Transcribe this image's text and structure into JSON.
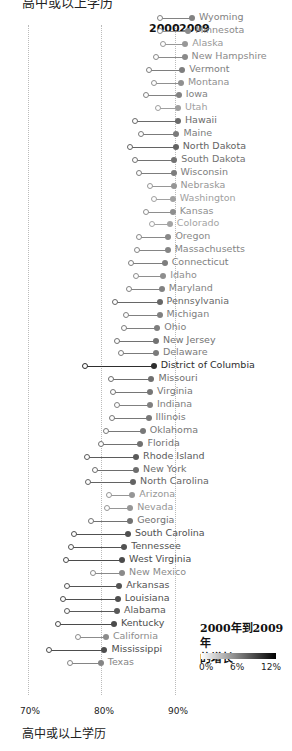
{
  "title_cut": "高中或以上学历",
  "headers": {
    "y2000": "2000",
    "y2009": "2009"
  },
  "axis": {
    "ticks": [
      "70%",
      "80%",
      "90%"
    ],
    "xtitle": "高中或以上学历"
  },
  "legend": {
    "title_line1": "2000年到2009年",
    "title_line2": "的增长",
    "ticks": [
      "0%",
      "6%",
      "12%"
    ]
  },
  "chart_data": {
    "type": "dot-plot",
    "title": "",
    "xlabel": "高中或以上学历",
    "xlim": [
      70,
      92
    ],
    "xticks": [
      "70%",
      "80%",
      "90%"
    ],
    "series_names": [
      "2000",
      "2009"
    ],
    "color_legend": {
      "title": "2000年到2009年的增长",
      "ticks": [
        "0%",
        "6%",
        "12%"
      ]
    },
    "rows": [
      {
        "state": "Wyoming",
        "v2000": 87.9,
        "v2009": 92.3
      },
      {
        "state": "Minnesota",
        "v2000": 87.9,
        "v2009": 91.8
      },
      {
        "state": "Alaska",
        "v2000": 88.3,
        "v2009": 91.4
      },
      {
        "state": "New Hampshire",
        "v2000": 87.4,
        "v2009": 91.3
      },
      {
        "state": "Vermont",
        "v2000": 86.4,
        "v2009": 91.0
      },
      {
        "state": "Montana",
        "v2000": 87.2,
        "v2009": 90.8
      },
      {
        "state": "Iowa",
        "v2000": 86.1,
        "v2009": 90.5
      },
      {
        "state": "Utah",
        "v2000": 87.7,
        "v2009": 90.4
      },
      {
        "state": "Hawaii",
        "v2000": 84.6,
        "v2009": 90.4
      },
      {
        "state": "Maine",
        "v2000": 85.4,
        "v2009": 90.2
      },
      {
        "state": "North Dakota",
        "v2000": 83.9,
        "v2009": 90.1
      },
      {
        "state": "South Dakota",
        "v2000": 84.6,
        "v2009": 89.9
      },
      {
        "state": "Wisconsin",
        "v2000": 85.1,
        "v2009": 89.8
      },
      {
        "state": "Nebraska",
        "v2000": 86.6,
        "v2009": 89.8
      },
      {
        "state": "Washington",
        "v2000": 87.1,
        "v2009": 89.7
      },
      {
        "state": "Kansas",
        "v2000": 86.0,
        "v2009": 89.7
      },
      {
        "state": "Colorado",
        "v2000": 86.9,
        "v2009": 89.3
      },
      {
        "state": "Oregon",
        "v2000": 85.1,
        "v2009": 89.1
      },
      {
        "state": "Massachusetts",
        "v2000": 84.8,
        "v2009": 89.0
      },
      {
        "state": "Connecticut",
        "v2000": 84.0,
        "v2009": 88.6
      },
      {
        "state": "Idaho",
        "v2000": 84.7,
        "v2009": 88.4
      },
      {
        "state": "Maryland",
        "v2000": 83.8,
        "v2009": 88.2
      },
      {
        "state": "Pennsylvania",
        "v2000": 81.9,
        "v2009": 87.9
      },
      {
        "state": "Michigan",
        "v2000": 83.4,
        "v2009": 87.9
      },
      {
        "state": "Ohio",
        "v2000": 83.0,
        "v2009": 87.6
      },
      {
        "state": "New Jersey",
        "v2000": 82.1,
        "v2009": 87.4
      },
      {
        "state": "Delaware",
        "v2000": 82.6,
        "v2009": 87.4
      },
      {
        "state": "District of Columbia",
        "v2000": 77.8,
        "v2009": 87.1
      },
      {
        "state": "Missouri",
        "v2000": 81.3,
        "v2009": 86.8
      },
      {
        "state": "Virginia",
        "v2000": 81.5,
        "v2009": 86.6
      },
      {
        "state": "Indiana",
        "v2000": 82.1,
        "v2009": 86.6
      },
      {
        "state": "Illinois",
        "v2000": 81.4,
        "v2009": 86.4
      },
      {
        "state": "Oklahoma",
        "v2000": 80.6,
        "v2009": 85.6
      },
      {
        "state": "Florida",
        "v2000": 79.9,
        "v2009": 85.3
      },
      {
        "state": "Rhode Island",
        "v2000": 78.0,
        "v2009": 84.7
      },
      {
        "state": "New York",
        "v2000": 79.1,
        "v2009": 84.7
      },
      {
        "state": "North Carolina",
        "v2000": 78.1,
        "v2009": 84.3
      },
      {
        "state": "Arizona",
        "v2000": 81.0,
        "v2009": 84.2
      },
      {
        "state": "Nevada",
        "v2000": 80.7,
        "v2009": 83.9
      },
      {
        "state": "Georgia",
        "v2000": 78.6,
        "v2009": 83.9
      },
      {
        "state": "South Carolina",
        "v2000": 76.3,
        "v2009": 83.6
      },
      {
        "state": "Tennessee",
        "v2000": 75.9,
        "v2009": 83.1
      },
      {
        "state": "West Virginia",
        "v2000": 75.2,
        "v2009": 82.8
      },
      {
        "state": "New Mexico",
        "v2000": 78.9,
        "v2009": 82.8
      },
      {
        "state": "Arkansas",
        "v2000": 75.3,
        "v2009": 82.4
      },
      {
        "state": "Louisiana",
        "v2000": 74.8,
        "v2009": 82.2
      },
      {
        "state": "Alabama",
        "v2000": 75.3,
        "v2009": 82.1
      },
      {
        "state": "Kentucky",
        "v2000": 74.1,
        "v2009": 81.7
      },
      {
        "state": "California",
        "v2000": 76.8,
        "v2009": 80.6
      },
      {
        "state": "Mississippi",
        "v2000": 72.9,
        "v2009": 80.4
      },
      {
        "state": "Texas",
        "v2000": 75.7,
        "v2009": 79.9
      }
    ]
  }
}
